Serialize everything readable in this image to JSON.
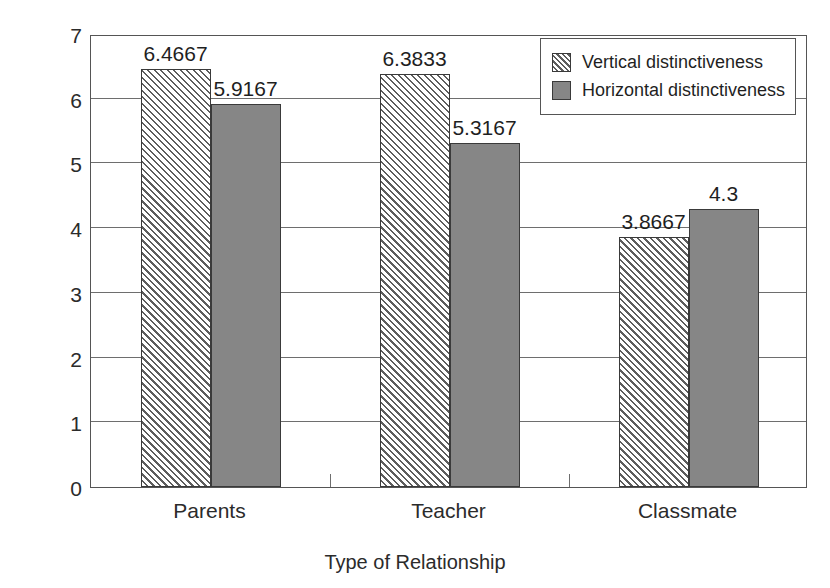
{
  "chart_data": {
    "type": "bar",
    "title": "",
    "xlabel": "Type of Relationship",
    "ylabel": "Feelings of having face",
    "categories": [
      "Parents",
      "Teacher",
      "Classmate"
    ],
    "series": [
      {
        "name": "Vertical distinctiveness",
        "fill": "hatched",
        "values": [
          6.4667,
          6.3833,
          3.8667
        ],
        "labels": [
          "6.4667",
          "6.3833",
          "3.8667"
        ]
      },
      {
        "name": "Horizontal distinctiveness",
        "fill": "solid",
        "color": "#868686",
        "values": [
          5.9167,
          5.3167,
          4.3
        ],
        "labels": [
          "5.9167",
          "5.3167",
          "4.3"
        ]
      }
    ],
    "ylim": [
      0,
      7
    ],
    "yticks": [
      0,
      1,
      2,
      3,
      4,
      5,
      6,
      7
    ],
    "ytick_labels": [
      "0",
      "1",
      "2",
      "3",
      "4",
      "5",
      "6",
      "7"
    ],
    "grid": true,
    "grid_axis": "y",
    "legend_position": "top-right",
    "legend_entries": [
      "Vertical distinctiveness",
      "Horizontal distinctiveness"
    ]
  },
  "axes": {
    "y_title": "Feelings of having face",
    "x_title": "Type of Relationship"
  },
  "legend": {
    "items": [
      {
        "label": "Vertical distinctiveness",
        "swatch": "hatched-swatch-icon"
      },
      {
        "label": "Horizontal distinctiveness",
        "swatch": "solid-gray-swatch-icon"
      }
    ]
  }
}
